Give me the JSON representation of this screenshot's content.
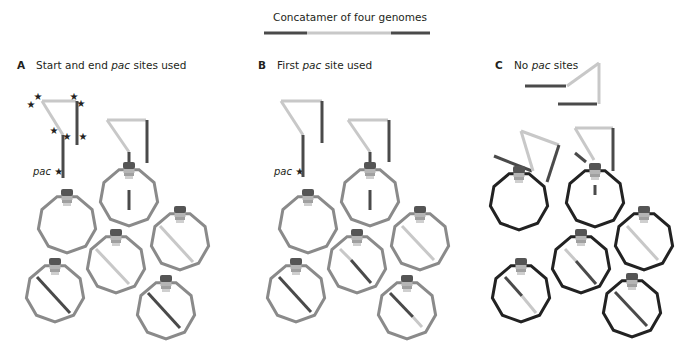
{
  "figure": {
    "title": "Concatamer of four genomes",
    "colors": {
      "dark_dna": "#4a4a4a",
      "light_dna": "#c8c8c8",
      "capsid_gray": "#8a8a8a",
      "capsid_black": "#222222",
      "portal_dark": "#555555",
      "portal_light": "#b5b5b5",
      "text": "#231f20"
    },
    "concatamer_bar": {
      "y": 33,
      "segments": [
        {
          "x1": 264,
          "x2": 307,
          "tone": "dark"
        },
        {
          "x1": 307,
          "x2": 350,
          "tone": "light"
        },
        {
          "x1": 350,
          "x2": 391,
          "tone": "light"
        },
        {
          "x1": 391,
          "x2": 430,
          "tone": "dark"
        }
      ]
    }
  },
  "panels": [
    {
      "id": "A",
      "letter": "A",
      "label_pre": "Start and end ",
      "label_italic": "pac",
      "label_post": " sites used",
      "label_x": 17,
      "pac_label": {
        "text": "pac",
        "star": "★",
        "x": 33,
        "y": 171
      },
      "capsid_style": "gray",
      "stars": [
        {
          "x": 38,
          "y": 100
        },
        {
          "x": 31,
          "y": 108
        },
        {
          "x": 74,
          "y": 100
        },
        {
          "x": 81,
          "y": 107
        },
        {
          "x": 54,
          "y": 134
        },
        {
          "x": 67,
          "y": 140
        },
        {
          "x": 83,
          "y": 140
        }
      ],
      "free_dna": [
        {
          "points": "42,101 76,101",
          "tone": "light"
        },
        {
          "points": "77,101 77,145",
          "tone": "dark"
        },
        {
          "points": "42,101 63,135",
          "tone": "light"
        },
        {
          "points": "63,135 63,178",
          "tone": "dark"
        },
        {
          "points": "107,120 146,120",
          "tone": "light"
        },
        {
          "points": "147,120 147,163",
          "tone": "dark"
        },
        {
          "points": "107,120 129,152",
          "tone": "light"
        },
        {
          "points": "129,152 129,168",
          "tone": "dark"
        }
      ],
      "capsids": [
        {
          "cx": 129,
          "cy": 197,
          "r": 29,
          "dna": [
            {
              "x1": 129,
              "y1": 190,
              "x2": 129,
              "y2": 210,
              "tone": "dark"
            }
          ]
        },
        {
          "cx": 67,
          "cy": 224,
          "r": 29,
          "dna": []
        },
        {
          "cx": 180,
          "cy": 241,
          "r": 29,
          "dna": [
            {
              "x1": 160,
              "y1": 226,
              "x2": 193,
              "y2": 262,
              "tone": "light"
            }
          ]
        },
        {
          "cx": 116,
          "cy": 264,
          "r": 29,
          "dna": [
            {
              "x1": 96,
              "y1": 249,
              "x2": 129,
              "y2": 284,
              "tone": "light"
            }
          ]
        },
        {
          "cx": 55,
          "cy": 293,
          "r": 29,
          "dna": [
            {
              "x1": 37,
              "y1": 277,
              "x2": 70,
              "y2": 313,
              "tone": "dark"
            }
          ]
        },
        {
          "cx": 166,
          "cy": 310,
          "r": 29,
          "dna": [
            {
              "x1": 148,
              "y1": 293,
              "x2": 180,
              "y2": 328,
              "tone": "dark"
            }
          ]
        }
      ]
    },
    {
      "id": "B",
      "letter": "B",
      "label_pre": "First ",
      "label_italic": "pac",
      "label_post": " site used",
      "label_x": 258,
      "pac_label": {
        "text": "pac",
        "star": "★",
        "x": 274,
        "y": 171
      },
      "capsid_style": "gray",
      "stars": [],
      "free_dna": [
        {
          "points": "281,101 322,101",
          "tone": "light"
        },
        {
          "points": "322,101 322,143",
          "tone": "dark"
        },
        {
          "points": "281,101 303,135",
          "tone": "light"
        },
        {
          "points": "303,135 303,177",
          "tone": "dark"
        },
        {
          "points": "348,120 388,120",
          "tone": "light"
        },
        {
          "points": "389,120 389,162",
          "tone": "dark"
        },
        {
          "points": "348,120 370,152",
          "tone": "light"
        },
        {
          "points": "370,152 370,168",
          "tone": "dark"
        }
      ],
      "capsids": [
        {
          "cx": 370,
          "cy": 197,
          "r": 29,
          "dna": [
            {
              "x1": 370,
              "y1": 190,
              "x2": 370,
              "y2": 210,
              "tone": "dark"
            }
          ]
        },
        {
          "cx": 308,
          "cy": 224,
          "r": 29,
          "dna": []
        },
        {
          "cx": 420,
          "cy": 241,
          "r": 29,
          "dna": [
            {
              "x1": 402,
              "y1": 226,
              "x2": 434,
              "y2": 260,
              "tone": "light"
            }
          ]
        },
        {
          "cx": 357,
          "cy": 264,
          "r": 29,
          "dna": [
            {
              "x1": 340,
              "y1": 249,
              "x2": 351,
              "y2": 260,
              "tone": "light"
            },
            {
              "x1": 351,
              "y1": 260,
              "x2": 371,
              "y2": 283,
              "tone": "dark"
            }
          ]
        },
        {
          "cx": 296,
          "cy": 293,
          "r": 29,
          "dna": [
            {
              "x1": 279,
              "y1": 277,
              "x2": 311,
              "y2": 312,
              "tone": "dark"
            }
          ]
        },
        {
          "cx": 407,
          "cy": 310,
          "r": 29,
          "dna": [
            {
              "x1": 390,
              "y1": 293,
              "x2": 413,
              "y2": 317,
              "tone": "dark"
            },
            {
              "x1": 413,
              "y1": 317,
              "x2": 422,
              "y2": 327,
              "tone": "light"
            }
          ]
        }
      ]
    },
    {
      "id": "C",
      "letter": "C",
      "label_pre": "No ",
      "label_italic": "pac",
      "label_post": " sites",
      "label_x": 495,
      "pac_label": null,
      "capsid_style": "black",
      "stars": [],
      "free_dna": [
        {
          "points": "525,86 566,86",
          "tone": "dark"
        },
        {
          "points": "567,86 599,63",
          "tone": "light"
        },
        {
          "points": "599,63 599,104",
          "tone": "light"
        },
        {
          "points": "558,104 597,104",
          "tone": "dark"
        },
        {
          "points": "494,156 532,171",
          "tone": "dark"
        },
        {
          "points": "521,131 533,171",
          "tone": "light"
        },
        {
          "points": "521,131 559,145",
          "tone": "light"
        },
        {
          "points": "559,145 547,182",
          "tone": "dark"
        },
        {
          "points": "575,128 613,128",
          "tone": "light"
        },
        {
          "points": "613,128 613,171",
          "tone": "dark"
        },
        {
          "points": "575,128 594,160",
          "tone": "light"
        },
        {
          "points": "575,153 586,162",
          "tone": "dark"
        }
      ],
      "capsids": [
        {
          "cx": 519,
          "cy": 201,
          "r": 29,
          "dna": []
        },
        {
          "cx": 595,
          "cy": 198,
          "r": 29,
          "dna": [
            {
              "x1": 595,
              "y1": 185,
              "x2": 595,
              "y2": 195,
              "tone": "dark"
            }
          ]
        },
        {
          "cx": 644,
          "cy": 241,
          "r": 29,
          "dna": [
            {
              "x1": 627,
              "y1": 226,
              "x2": 658,
              "y2": 260,
              "tone": "light"
            }
          ]
        },
        {
          "cx": 581,
          "cy": 264,
          "r": 29,
          "dna": [
            {
              "x1": 565,
              "y1": 249,
              "x2": 576,
              "y2": 261,
              "tone": "light"
            },
            {
              "x1": 576,
              "y1": 261,
              "x2": 596,
              "y2": 284,
              "tone": "dark"
            }
          ]
        },
        {
          "cx": 521,
          "cy": 293,
          "r": 29,
          "dna": [
            {
              "x1": 505,
              "y1": 277,
              "x2": 522,
              "y2": 296,
              "tone": "dark"
            },
            {
              "x1": 522,
              "y1": 296,
              "x2": 536,
              "y2": 313,
              "tone": "light"
            }
          ]
        },
        {
          "cx": 632,
          "cy": 308,
          "r": 29,
          "dna": [
            {
              "x1": 615,
              "y1": 292,
              "x2": 647,
              "y2": 326,
              "tone": "dark"
            }
          ]
        }
      ]
    }
  ]
}
